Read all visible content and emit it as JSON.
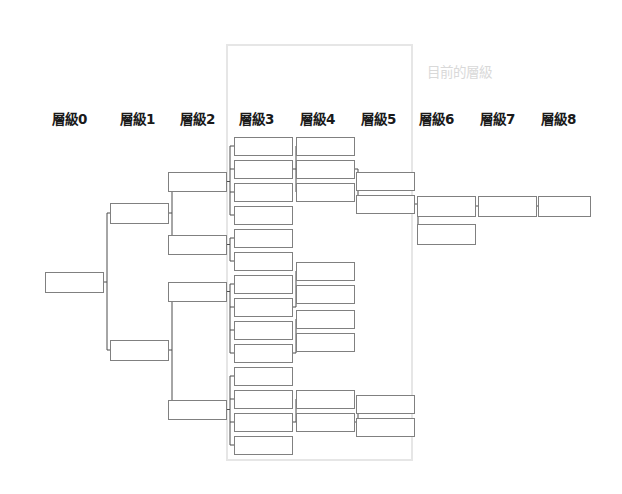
{
  "canvas": {
    "width": 622,
    "height": 494,
    "background": "#ffffff"
  },
  "annotations": {
    "current_level_note": "目前的層級",
    "current_level_note_color": "#d9d9d9",
    "current_level_note_x": 427,
    "current_level_note_y": 66
  },
  "colors": {
    "node_stroke": "#808080",
    "node_fill": "#ffffff",
    "edge_stroke": "#4d4d4d",
    "highlight_stroke": "#e6e6e6",
    "label_color": "#1a1a1a",
    "muted_label_color": "#d9d9d9"
  },
  "highlight_region": {
    "name": "current-level-region",
    "x": 227,
    "y": 45,
    "width": 185,
    "height": 415,
    "stroke": "#e6e6e6",
    "stroke_width": 2
  },
  "level_labels": [
    {
      "text": "層級0",
      "x": 52,
      "y": 113
    },
    {
      "text": "層級1",
      "x": 120,
      "y": 113
    },
    {
      "text": "層級2",
      "x": 180,
      "y": 113
    },
    {
      "text": "層級3",
      "x": 239,
      "y": 113
    },
    {
      "text": "層級4",
      "x": 300,
      "y": 113
    },
    {
      "text": "層級5",
      "x": 361,
      "y": 113
    },
    {
      "text": "層級6",
      "x": 419,
      "y": 113
    },
    {
      "text": "層級7",
      "x": 480,
      "y": 113
    },
    {
      "text": "層級8",
      "x": 541,
      "y": 113
    }
  ],
  "node_geometry": {
    "box_height": 18,
    "level_x": [
      45,
      110,
      168,
      234,
      296,
      356,
      417,
      478,
      538
    ],
    "level_width": [
      58,
      58,
      58,
      58,
      58,
      58,
      58,
      58,
      52
    ]
  },
  "nodes": [
    {
      "id": "L0-0",
      "level": 0,
      "x": 45,
      "y": 272,
      "w": 58,
      "h": 20
    },
    {
      "id": "L1-0",
      "level": 1,
      "x": 110,
      "y": 203,
      "w": 58,
      "h": 20
    },
    {
      "id": "L1-1",
      "level": 1,
      "x": 110,
      "y": 340,
      "w": 58,
      "h": 20
    },
    {
      "id": "L2-0",
      "level": 2,
      "x": 168,
      "y": 172,
      "w": 58,
      "h": 19
    },
    {
      "id": "L2-1",
      "level": 2,
      "x": 168,
      "y": 235,
      "w": 58,
      "h": 19
    },
    {
      "id": "L2-2",
      "level": 2,
      "x": 168,
      "y": 282,
      "w": 58,
      "h": 19
    },
    {
      "id": "L2-3",
      "level": 2,
      "x": 168,
      "y": 400,
      "w": 58,
      "h": 19
    },
    {
      "id": "L3-0",
      "level": 3,
      "x": 234,
      "y": 137,
      "w": 58,
      "h": 18
    },
    {
      "id": "L3-1",
      "level": 3,
      "x": 234,
      "y": 160,
      "w": 58,
      "h": 18
    },
    {
      "id": "L3-2",
      "level": 3,
      "x": 234,
      "y": 183,
      "w": 58,
      "h": 18
    },
    {
      "id": "L3-3",
      "level": 3,
      "x": 234,
      "y": 206,
      "w": 58,
      "h": 18
    },
    {
      "id": "L3-4",
      "level": 3,
      "x": 234,
      "y": 229,
      "w": 58,
      "h": 18
    },
    {
      "id": "L3-5",
      "level": 3,
      "x": 234,
      "y": 252,
      "w": 58,
      "h": 18
    },
    {
      "id": "L3-6",
      "level": 3,
      "x": 234,
      "y": 275,
      "w": 58,
      "h": 18
    },
    {
      "id": "L3-7",
      "level": 3,
      "x": 234,
      "y": 298,
      "w": 58,
      "h": 18
    },
    {
      "id": "L3-8",
      "level": 3,
      "x": 234,
      "y": 321,
      "w": 58,
      "h": 18
    },
    {
      "id": "L3-9",
      "level": 3,
      "x": 234,
      "y": 344,
      "w": 58,
      "h": 18
    },
    {
      "id": "L3-10",
      "level": 3,
      "x": 234,
      "y": 367,
      "w": 58,
      "h": 18
    },
    {
      "id": "L3-11",
      "level": 3,
      "x": 234,
      "y": 390,
      "w": 58,
      "h": 18
    },
    {
      "id": "L3-12",
      "level": 3,
      "x": 234,
      "y": 413,
      "w": 58,
      "h": 18
    },
    {
      "id": "L3-13",
      "level": 3,
      "x": 234,
      "y": 436,
      "w": 58,
      "h": 18
    },
    {
      "id": "L4-0",
      "level": 4,
      "x": 296,
      "y": 137,
      "w": 58,
      "h": 18
    },
    {
      "id": "L4-1",
      "level": 4,
      "x": 296,
      "y": 160,
      "w": 58,
      "h": 18
    },
    {
      "id": "L4-2",
      "level": 4,
      "x": 296,
      "y": 183,
      "w": 58,
      "h": 18
    },
    {
      "id": "L4-3",
      "level": 4,
      "x": 296,
      "y": 262,
      "w": 58,
      "h": 18
    },
    {
      "id": "L4-4",
      "level": 4,
      "x": 296,
      "y": 285,
      "w": 58,
      "h": 18
    },
    {
      "id": "L4-5",
      "level": 4,
      "x": 296,
      "y": 310,
      "w": 58,
      "h": 18
    },
    {
      "id": "L4-6",
      "level": 4,
      "x": 296,
      "y": 333,
      "w": 58,
      "h": 18
    },
    {
      "id": "L4-7",
      "level": 4,
      "x": 296,
      "y": 390,
      "w": 58,
      "h": 18
    },
    {
      "id": "L4-8",
      "level": 4,
      "x": 296,
      "y": 413,
      "w": 58,
      "h": 18
    },
    {
      "id": "L5-0",
      "level": 5,
      "x": 356,
      "y": 172,
      "w": 58,
      "h": 18
    },
    {
      "id": "L5-1",
      "level": 5,
      "x": 356,
      "y": 195,
      "w": 58,
      "h": 18
    },
    {
      "id": "L5-2",
      "level": 5,
      "x": 356,
      "y": 395,
      "w": 58,
      "h": 18
    },
    {
      "id": "L5-3",
      "level": 5,
      "x": 356,
      "y": 418,
      "w": 58,
      "h": 18
    },
    {
      "id": "L6-0",
      "level": 6,
      "x": 417,
      "y": 196,
      "w": 58,
      "h": 20
    },
    {
      "id": "L6-1",
      "level": 6,
      "x": 417,
      "y": 224,
      "w": 58,
      "h": 20
    },
    {
      "id": "L7-0",
      "level": 7,
      "x": 478,
      "y": 196,
      "w": 58,
      "h": 20
    },
    {
      "id": "L8-0",
      "level": 8,
      "x": 538,
      "y": 196,
      "w": 52,
      "h": 20
    }
  ],
  "edges": [
    {
      "from": "L0-0",
      "to": "L1-0"
    },
    {
      "from": "L0-0",
      "to": "L1-1"
    },
    {
      "from": "L1-0",
      "to": "L2-0"
    },
    {
      "from": "L1-0",
      "to": "L2-1"
    },
    {
      "from": "L1-1",
      "to": "L2-2"
    },
    {
      "from": "L1-1",
      "to": "L2-3"
    },
    {
      "from": "L2-0",
      "to": "L3-0"
    },
    {
      "from": "L2-0",
      "to": "L3-1"
    },
    {
      "from": "L2-0",
      "to": "L3-2"
    },
    {
      "from": "L2-0",
      "to": "L3-3"
    },
    {
      "from": "L2-1",
      "to": "L3-4"
    },
    {
      "from": "L2-1",
      "to": "L3-5"
    },
    {
      "from": "L2-2",
      "to": "L3-6"
    },
    {
      "from": "L2-2",
      "to": "L3-7"
    },
    {
      "from": "L2-2",
      "to": "L3-8"
    },
    {
      "from": "L2-2",
      "to": "L3-9"
    },
    {
      "from": "L2-3",
      "to": "L3-10"
    },
    {
      "from": "L2-3",
      "to": "L3-11"
    },
    {
      "from": "L2-3",
      "to": "L3-12"
    },
    {
      "from": "L2-3",
      "to": "L3-13"
    },
    {
      "from": "L3-1",
      "to": "L4-0"
    },
    {
      "from": "L3-1",
      "to": "L4-1"
    },
    {
      "from": "L3-1",
      "to": "L4-2"
    },
    {
      "from": "L3-7",
      "to": "L4-3"
    },
    {
      "from": "L3-7",
      "to": "L4-4"
    },
    {
      "from": "L3-9",
      "to": "L4-5"
    },
    {
      "from": "L3-9",
      "to": "L4-6"
    },
    {
      "from": "L3-12",
      "to": "L4-7"
    },
    {
      "from": "L3-12",
      "to": "L4-8"
    },
    {
      "from": "L4-1",
      "to": "L5-0"
    },
    {
      "from": "L4-1",
      "to": "L5-1"
    },
    {
      "from": "L4-8",
      "to": "L5-2"
    },
    {
      "from": "L4-8",
      "to": "L5-3"
    },
    {
      "from": "L5-1",
      "to": "L6-0"
    },
    {
      "from": "L5-1",
      "to": "L6-1"
    },
    {
      "from": "L6-0",
      "to": "L7-0"
    },
    {
      "from": "L7-0",
      "to": "L8-0"
    }
  ]
}
